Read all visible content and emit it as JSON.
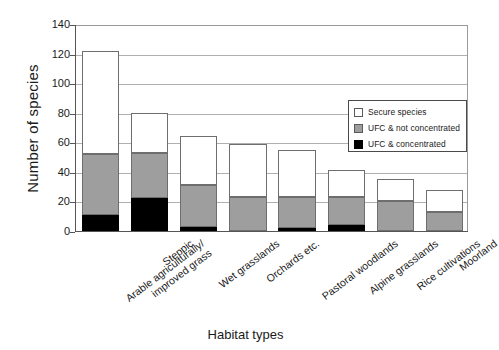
{
  "chart_data": {
    "type": "bar",
    "subtype": "stacked-vertical",
    "title": "",
    "xlabel": "Habitat types",
    "ylabel": "Number of species",
    "ylim": [
      0,
      140
    ],
    "ytick_values": [
      0,
      20,
      40,
      60,
      80,
      100,
      120,
      140
    ],
    "ytick_labels": [
      "0",
      "20",
      "40",
      "60",
      "80",
      "100",
      "120",
      "140"
    ],
    "grid": "horizontal",
    "legend_position": "upper-right-inside",
    "categories": [
      "Arable agriculturally/ improved grass",
      "Steppic",
      "Wet grasslands",
      "Orchards etc.",
      "Pastoral woodlands",
      "Alpine grasslands",
      "Rice cultivations",
      "Moorland"
    ],
    "category_lines": [
      [
        "Arable agriculturally/",
        "improved grass"
      ],
      [
        "Steppic"
      ],
      [
        "Wet grasslands"
      ],
      [
        "Orchards etc."
      ],
      [
        "Pastoral woodlands"
      ],
      [
        "Alpine grasslands"
      ],
      [
        "Rice cultivations"
      ],
      [
        "Moorland"
      ]
    ],
    "series": [
      {
        "name": "UFC & concentrated",
        "key": "conc",
        "color": "#000000",
        "values": [
          11,
          22,
          3,
          0,
          2,
          4,
          0,
          0
        ]
      },
      {
        "name": "UFC & not concentrated",
        "key": "notconc",
        "color": "#9e9e9e",
        "values": [
          41,
          31,
          28,
          23,
          21,
          19,
          20,
          13
        ]
      },
      {
        "name": "Secure species",
        "key": "secure",
        "color": "#ffffff",
        "values": [
          70,
          27,
          33,
          36,
          32,
          18,
          15,
          15
        ]
      }
    ],
    "totals": [
      122,
      80,
      64,
      59,
      55,
      41,
      35,
      28
    ]
  },
  "legend": {
    "items": [
      {
        "label": "Secure species",
        "key": "secure"
      },
      {
        "label": "UFC & not concentrated",
        "key": "notconc"
      },
      {
        "label": "UFC & concentrated",
        "key": "conc"
      }
    ]
  }
}
